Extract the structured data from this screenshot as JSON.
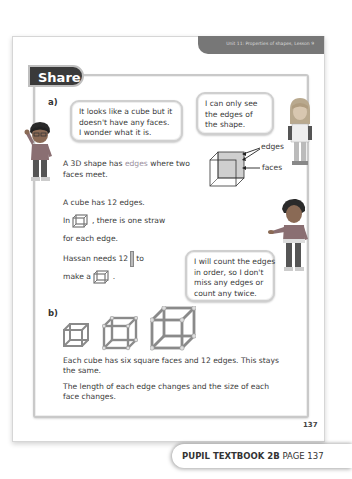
{
  "header": {
    "unit_label": "Unit 11: Properties of shapes, Lesson 9"
  },
  "section": {
    "title": "Share"
  },
  "part_a": {
    "label": "a)",
    "bubble_left": [
      "It looks like a cube but it",
      "doesn't have any faces.",
      "I wonder what it is."
    ],
    "bubble_right": [
      "I can only see",
      "the edges of",
      "the shape."
    ],
    "definition": {
      "prefix": "A 3D shape has ",
      "highlight": "edges",
      "suffix": " where two",
      "line2": "faces meet."
    },
    "diagram_labels": {
      "edges": "edges",
      "faces": "faces"
    },
    "cube_edges": "A cube has 12 edges.",
    "straw_line1_pre": "In",
    "straw_line1_post": ", there is one straw",
    "straw_line2": "for each edge.",
    "hassan_pre": "Hassan needs 12",
    "hassan_post": "to",
    "make_pre": "make a",
    "make_post": ".",
    "bubble_bottom": [
      "I will count the edges",
      "in order, so I don't",
      "miss any edges or",
      "count any twice."
    ]
  },
  "part_b": {
    "label": "b)",
    "para1_line1": "Each cube has six square faces and 12 edges. This stays",
    "para1_line2": "the same.",
    "para2_line1": "The length of each edge changes and the size of each",
    "para2_line2": "face changes."
  },
  "footer": {
    "page_number": "137",
    "book_label": "PUPIL TEXTBOOK 2B",
    "page_label": "PAGE 137"
  },
  "colors": {
    "tab_dark": "#3a3a3a",
    "unit_bar": "#777777",
    "highlight": "#9a8f9d",
    "frame": "#c9c9c9"
  }
}
